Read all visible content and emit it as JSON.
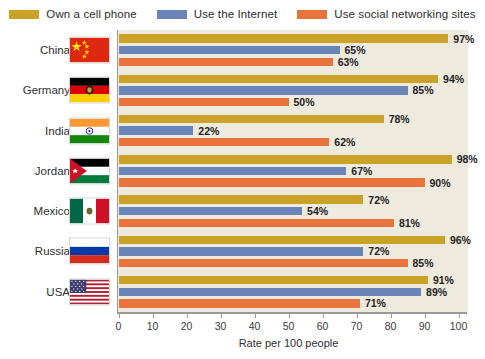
{
  "chart_data": {
    "type": "bar",
    "orientation": "horizontal",
    "title": "",
    "xlabel": "Rate per 100 people",
    "ylabel": "",
    "xlim": [
      0,
      100
    ],
    "xticks": [
      0,
      10,
      20,
      30,
      40,
      50,
      60,
      70,
      80,
      90,
      100
    ],
    "grid": false,
    "legend_position": "top",
    "categories": [
      "China",
      "Germany",
      "India",
      "Jordan",
      "Mexico",
      "Russia",
      "USA"
    ],
    "series": [
      {
        "name": "Own a cell phone",
        "color": "#c9a227",
        "values": [
          97,
          94,
          78,
          98,
          72,
          96,
          91
        ],
        "labels": [
          "97%",
          "94%",
          "78%",
          "98%",
          "72%",
          "96%",
          "91%"
        ]
      },
      {
        "name": "Use the Internet",
        "color": "#6b84b8",
        "values": [
          65,
          85,
          22,
          67,
          54,
          72,
          89
        ],
        "labels": [
          "65%",
          "85%",
          "22%",
          "67%",
          "54%",
          "72%",
          "89%"
        ]
      },
      {
        "name": "Use social networking sites",
        "color": "#e8743b",
        "values": [
          63,
          50,
          62,
          90,
          81,
          85,
          71
        ],
        "labels": [
          "63%",
          "50%",
          "62%",
          "90%",
          "81%",
          "85%",
          "71%"
        ]
      }
    ]
  },
  "legend": {
    "items": [
      {
        "label": "Own a cell phone",
        "color": "#c9a227",
        "icon": "legend-swatch-gold"
      },
      {
        "label": "Use the Internet",
        "color": "#6b84b8",
        "icon": "legend-swatch-blue"
      },
      {
        "label": "Use social networking sites",
        "color": "#e8743b",
        "icon": "legend-swatch-orange"
      }
    ]
  },
  "axis": {
    "x_title": "Rate per 100 people",
    "tick_labels": [
      "0",
      "10",
      "20",
      "30",
      "40",
      "50",
      "60",
      "70",
      "80",
      "90",
      "100"
    ]
  },
  "rows": [
    {
      "country": "China",
      "flag": "flag-china"
    },
    {
      "country": "Germany",
      "flag": "flag-germany"
    },
    {
      "country": "India",
      "flag": "flag-india"
    },
    {
      "country": "Jordan",
      "flag": "flag-jordan"
    },
    {
      "country": "Mexico",
      "flag": "flag-mexico"
    },
    {
      "country": "Russia",
      "flag": "flag-russia"
    },
    {
      "country": "USA",
      "flag": "flag-usa"
    }
  ],
  "style": {
    "plot_background": "#efeade",
    "page_background": "#ffffff",
    "axis_color": "#9a9a92"
  }
}
